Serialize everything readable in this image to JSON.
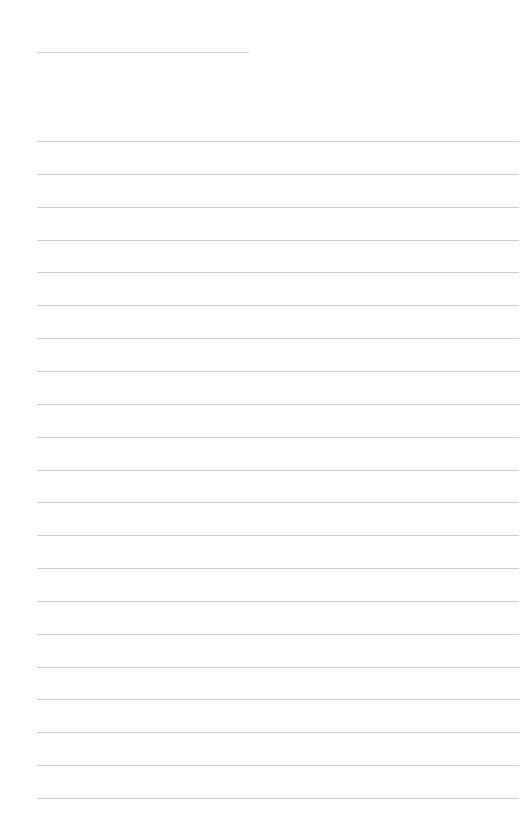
{
  "page": {
    "type": "blank-lined-sheet",
    "background_color": "#ffffff",
    "line_color": "#cdcdcd",
    "header_line": {
      "x": 37,
      "y": 52,
      "width": 212
    },
    "rules": {
      "count": 21,
      "x": 37,
      "width": 482,
      "first_y": 141,
      "spacing": 32.85
    },
    "text": ""
  }
}
